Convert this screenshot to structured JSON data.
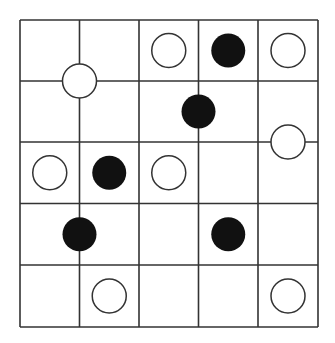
{
  "puzzle": {
    "rows": 5,
    "cols": 5,
    "colors": {
      "line": "#333333",
      "white_fill": "#ffffff",
      "black_fill": "#111111",
      "stroke": "#333333"
    },
    "stones": [
      {
        "color": "white",
        "col": 2.5,
        "row": 0.5
      },
      {
        "color": "black",
        "col": 3.5,
        "row": 0.5
      },
      {
        "color": "white",
        "col": 4.5,
        "row": 0.5
      },
      {
        "color": "white",
        "col": 1.0,
        "row": 1.0
      },
      {
        "color": "black",
        "col": 3.0,
        "row": 1.5
      },
      {
        "color": "white",
        "col": 4.5,
        "row": 2.0
      },
      {
        "color": "white",
        "col": 0.5,
        "row": 2.5
      },
      {
        "color": "black",
        "col": 1.5,
        "row": 2.5
      },
      {
        "color": "white",
        "col": 2.5,
        "row": 2.5
      },
      {
        "color": "black",
        "col": 1.0,
        "row": 3.5
      },
      {
        "color": "black",
        "col": 3.5,
        "row": 3.5
      },
      {
        "color": "white",
        "col": 1.5,
        "row": 4.5
      },
      {
        "color": "white",
        "col": 4.5,
        "row": 4.5
      }
    ]
  }
}
